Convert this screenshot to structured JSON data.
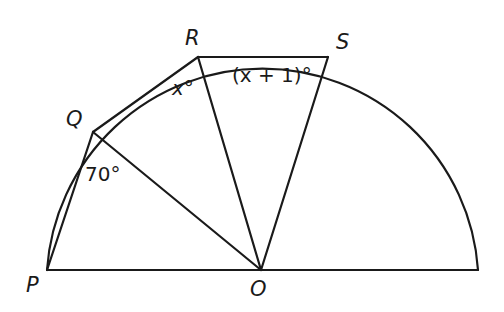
{
  "diagram": {
    "type": "semicircle-geometry",
    "points": {
      "P": {
        "label": "P",
        "x": 47,
        "y": 270
      },
      "O": {
        "label": "O",
        "x": 261,
        "y": 270
      },
      "Q": {
        "label": "Q",
        "x": 93,
        "y": 132
      },
      "R": {
        "label": "R",
        "x": 198,
        "y": 57
      },
      "S": {
        "label": "S",
        "x": 328,
        "y": 57
      },
      "E": {
        "x": 478,
        "y": 270
      }
    },
    "segments": [
      "P-O",
      "O-E",
      "P-Q",
      "Q-R",
      "R-S",
      "Q-O",
      "R-O",
      "S-O"
    ],
    "arc": {
      "from": "P",
      "to": "E",
      "centre": "O",
      "radius": 216
    },
    "angles": {
      "PQO": {
        "text": "70°",
        "vertex": "Q"
      },
      "QRO": {
        "text": "x°",
        "vertex": "R"
      },
      "RSO": {
        "text": "(x + 1)°",
        "vertex": "S"
      }
    },
    "stroke_color": "#1a1a1a",
    "background": "#ffffff"
  }
}
